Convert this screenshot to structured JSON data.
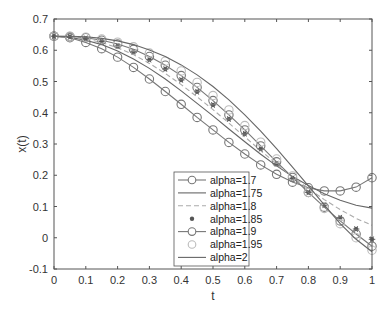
{
  "chart_data": {
    "type": "line",
    "title": "",
    "xlabel": "t",
    "ylabel": "x(t)",
    "xlim": [
      0,
      1
    ],
    "ylim": [
      -0.1,
      0.7
    ],
    "xticks": [
      "0",
      "0.1",
      "0.2",
      "0.3",
      "0.4",
      "0.5",
      "0.6",
      "0.7",
      "0.8",
      "0.9",
      "1"
    ],
    "yticks": [
      "-0.1",
      "0",
      "0.1",
      "0.2",
      "0.3",
      "0.4",
      "0.5",
      "0.6",
      "0.7"
    ],
    "grid": false,
    "legend_position": "lower center-left inside",
    "x": [
      0,
      0.05,
      0.1,
      0.15,
      0.2,
      0.25,
      0.3,
      0.35,
      0.4,
      0.45,
      0.5,
      0.55,
      0.6,
      0.65,
      0.7,
      0.75,
      0.8,
      0.85,
      0.9,
      0.95,
      1.0
    ],
    "series": [
      {
        "name": "alpha=1.7",
        "style": "line-circle",
        "values": [
          0.645,
          0.64,
          0.625,
          0.605,
          0.578,
          0.545,
          0.508,
          0.468,
          0.427,
          0.385,
          0.345,
          0.305,
          0.268,
          0.233,
          0.203,
          0.178,
          0.16,
          0.15,
          0.15,
          0.162,
          0.192
        ]
      },
      {
        "name": "alpha=1.75",
        "style": "line",
        "values": [
          0.645,
          0.641,
          0.632,
          0.618,
          0.598,
          0.572,
          0.542,
          0.508,
          0.47,
          0.43,
          0.39,
          0.348,
          0.307,
          0.267,
          0.23,
          0.196,
          0.167,
          0.141,
          0.12,
          0.104,
          0.095
        ]
      },
      {
        "name": "alpha=1.8",
        "style": "dashed",
        "values": [
          0.645,
          0.642,
          0.636,
          0.625,
          0.608,
          0.586,
          0.558,
          0.526,
          0.49,
          0.451,
          0.41,
          0.367,
          0.323,
          0.279,
          0.236,
          0.195,
          0.157,
          0.122,
          0.09,
          0.062,
          0.04
        ]
      },
      {
        "name": "alpha=1.85",
        "style": "asterisk",
        "values": [
          0.645,
          0.643,
          0.638,
          0.628,
          0.614,
          0.595,
          0.57,
          0.54,
          0.505,
          0.467,
          0.425,
          0.38,
          0.333,
          0.285,
          0.237,
          0.19,
          0.145,
          0.104,
          0.064,
          0.028,
          -0.005
        ]
      },
      {
        "name": "alpha=1.9",
        "style": "line-circle",
        "values": [
          0.645,
          0.644,
          0.64,
          0.632,
          0.62,
          0.603,
          0.58,
          0.552,
          0.519,
          0.481,
          0.439,
          0.393,
          0.345,
          0.294,
          0.243,
          0.193,
          0.145,
          0.098,
          0.054,
          0.012,
          -0.027
        ]
      },
      {
        "name": "alpha=1.95",
        "style": "circle",
        "values": [
          0.645,
          0.645,
          0.642,
          0.636,
          0.626,
          0.611,
          0.591,
          0.565,
          0.534,
          0.497,
          0.455,
          0.409,
          0.359,
          0.306,
          0.252,
          0.198,
          0.145,
          0.094,
          0.045,
          0.0,
          -0.04
        ]
      },
      {
        "name": "alpha=2",
        "style": "line",
        "values": [
          0.645,
          0.645,
          0.643,
          0.638,
          0.63,
          0.618,
          0.601,
          0.58,
          0.553,
          0.521,
          0.484,
          0.441,
          0.393,
          0.341,
          0.285,
          0.226,
          0.166,
          0.105,
          0.045,
          -0.005,
          -0.045
        ]
      }
    ]
  },
  "legend": {
    "entries": [
      "alpha=1.7",
      "alpha=1.75",
      "alpha=1.8",
      "alpha=1.85",
      "alpha=1.9",
      "alpha=1.95",
      "alpha=2"
    ]
  },
  "axes": {
    "xlabel": "t",
    "ylabel": "x(t)"
  }
}
